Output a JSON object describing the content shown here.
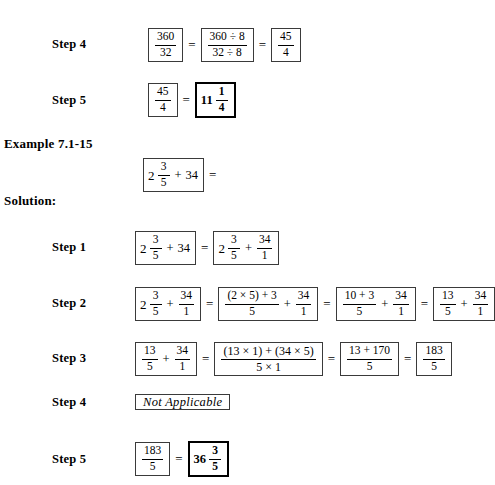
{
  "document": {
    "headings": {
      "example": "Example 7.1-15",
      "solution": "Solution:"
    },
    "step_labels": {
      "s1": "Step 1",
      "s2": "Step 2",
      "s3": "Step 3",
      "s4": "Step 4",
      "s5": "Step 5",
      "top_s4": "Step 4",
      "top_s5": "Step 5"
    },
    "symbols": {
      "equals": "=",
      "plus": "+",
      "times": "×",
      "divide": "÷",
      "lparen": "(",
      "rparen": ")"
    },
    "top_step4": {
      "f1": {
        "num": "360",
        "den": "32"
      },
      "f2": {
        "num": "360 ÷ 8",
        "den": "32 ÷ 8"
      },
      "f3": {
        "num": "45",
        "den": "4"
      }
    },
    "top_step5": {
      "f1": {
        "num": "45",
        "den": "4"
      },
      "mixed": {
        "whole": "11",
        "num": "1",
        "den": "4"
      }
    },
    "problem": {
      "whole": "2",
      "num": "3",
      "den": "5",
      "plus": "+",
      "addend": "34",
      "trailing_equals": "="
    },
    "step1": {
      "left": {
        "whole": "2",
        "num": "3",
        "den": "5",
        "plus": "+",
        "addend": "34"
      },
      "right": {
        "whole": "2",
        "num": "3",
        "den": "5",
        "plus": "+",
        "f_num": "34",
        "f_den": "1"
      }
    },
    "step2": {
      "b1": {
        "whole": "2",
        "num": "3",
        "den": "5",
        "plus": "+",
        "f_num": "34",
        "f_den": "1"
      },
      "b2": {
        "num": "(2 × 5) + 3",
        "den": "5",
        "plus": "+",
        "f_num": "34",
        "f_den": "1"
      },
      "b3": {
        "num": "10 + 3",
        "den": "5",
        "plus": "+",
        "f_num": "34",
        "f_den": "1"
      },
      "b4": {
        "num": "13",
        "den": "5",
        "plus": "+",
        "f_num": "34",
        "f_den": "1"
      }
    },
    "step3": {
      "b1": {
        "num": "13",
        "den": "5",
        "plus": "+",
        "f_num": "34",
        "f_den": "1"
      },
      "b2": {
        "num": "(13 × 1) + (34 × 5)",
        "den": "5 × 1"
      },
      "b3": {
        "num": "13 + 170",
        "den": "5"
      },
      "b4": {
        "num": "183",
        "den": "5"
      }
    },
    "step4": {
      "note": "Not  Applicable"
    },
    "step5": {
      "f1": {
        "num": "183",
        "den": "5"
      },
      "mixed": {
        "whole": "36",
        "num": "3",
        "den": "5"
      }
    }
  }
}
